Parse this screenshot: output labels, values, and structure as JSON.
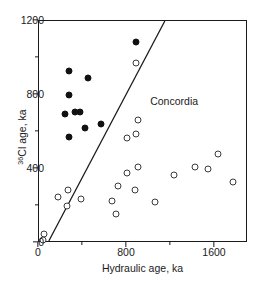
{
  "chart_data": {
    "type": "scatter",
    "title": "",
    "xlabel": "Hydraulic age, ka",
    "ylabel": "36Cl age, ka",
    "ylabel_sup": "36",
    "ylabel_rest": "Cl age, ka",
    "xlim": [
      0,
      1900
    ],
    "ylim": [
      0,
      1200
    ],
    "xticks": [
      0,
      800,
      1600
    ],
    "xticklabels": [
      "0",
      "800",
      "1600"
    ],
    "xminorticks": [
      400,
      1200
    ],
    "yticks": [
      0,
      400,
      800,
      1200
    ],
    "yticklabels": [
      "0",
      "400",
      "800",
      "1200"
    ],
    "yminorticks": [
      200,
      600,
      1000
    ],
    "grid": false,
    "legend": "none",
    "annotations": [
      {
        "text": "Concordia",
        "x": 1020,
        "y": 760
      }
    ],
    "lines": [
      {
        "name": "Concordia",
        "x": [
          90,
          1155
        ],
        "y": [
          0,
          1200
        ],
        "style": "solid",
        "color": "#1a1a1a"
      }
    ],
    "series": [
      {
        "name": "filled",
        "marker": "filled-circle",
        "color": "#111111",
        "points": [
          {
            "x": 275,
            "y": 930
          },
          {
            "x": 445,
            "y": 890
          },
          {
            "x": 270,
            "y": 800
          },
          {
            "x": 240,
            "y": 700
          },
          {
            "x": 330,
            "y": 710
          },
          {
            "x": 375,
            "y": 710
          },
          {
            "x": 415,
            "y": 620
          },
          {
            "x": 275,
            "y": 575
          },
          {
            "x": 565,
            "y": 645
          },
          {
            "x": 880,
            "y": 1085
          }
        ]
      },
      {
        "name": "open",
        "marker": "open-circle",
        "color": "#3a3a3a",
        "points": [
          {
            "x": 880,
            "y": 975
          },
          {
            "x": 900,
            "y": 665
          },
          {
            "x": 880,
            "y": 590
          },
          {
            "x": 800,
            "y": 565
          },
          {
            "x": 1625,
            "y": 480
          },
          {
            "x": 900,
            "y": 410
          },
          {
            "x": 1420,
            "y": 410
          },
          {
            "x": 1540,
            "y": 400
          },
          {
            "x": 800,
            "y": 380
          },
          {
            "x": 1230,
            "y": 370
          },
          {
            "x": 1760,
            "y": 330
          },
          {
            "x": 720,
            "y": 310
          },
          {
            "x": 260,
            "y": 285
          },
          {
            "x": 170,
            "y": 250
          },
          {
            "x": 380,
            "y": 240
          },
          {
            "x": 875,
            "y": 285
          },
          {
            "x": 660,
            "y": 225
          },
          {
            "x": 1055,
            "y": 220
          },
          {
            "x": 250,
            "y": 200
          },
          {
            "x": 700,
            "y": 155
          },
          {
            "x": 45,
            "y": 50
          },
          {
            "x": 40,
            "y": 15
          }
        ]
      }
    ]
  }
}
